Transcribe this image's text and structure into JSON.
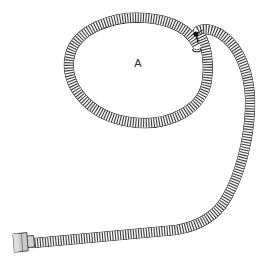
{
  "figure": {
    "label": "A",
    "background_color": "#ffffff"
  },
  "annotations": [
    {
      "name": "coil-label",
      "text": "A",
      "x": 138,
      "y": 64,
      "color": "#2b2b2b"
    }
  ],
  "colors": {
    "outline": "#2f2f2f",
    "rib": "#3a3a3a",
    "rib_light": "#6e6e6e",
    "fitting_fill": "#c9c9c9",
    "fitting_fill_light": "#dcdcdc",
    "fitting_outline": "#4a4a4a",
    "crossing_dot": "#111111",
    "tube_fill": "#ffffff"
  },
  "geometry": {
    "tube_width": 9,
    "rib_spacing": 2.6,
    "coil": {
      "center_x": 137,
      "center_y": 70,
      "radius_x": 70,
      "radius_y": 53
    },
    "crossing_point": {
      "x": 196,
      "y": 34
    },
    "inner_end_cap": {
      "x": 197,
      "y": 49
    },
    "outer_sweep_max_x": 251,
    "end_fitting": {
      "x": 12,
      "y": 236,
      "width": 16,
      "height": 22
    }
  },
  "parts": [
    {
      "name": "coil-loop",
      "label": "A"
    },
    {
      "name": "outer-sweep",
      "label": ""
    },
    {
      "name": "bottom-run",
      "label": ""
    },
    {
      "name": "end-fitting",
      "label": ""
    },
    {
      "name": "inner-end-cap",
      "label": ""
    },
    {
      "name": "crossing-dot",
      "label": ""
    }
  ]
}
